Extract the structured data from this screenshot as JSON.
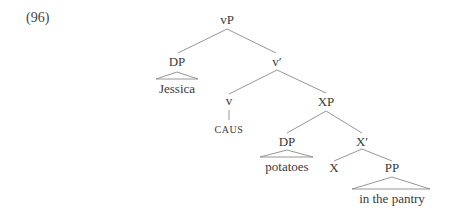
{
  "example": {
    "number": "(96)"
  },
  "tree": {
    "nodes": {
      "vP": "vP",
      "DP_subj": "DP",
      "v_bar": "v′",
      "v": "v",
      "XP": "XP",
      "DP_obj": "DP",
      "X_bar": "X′",
      "X": "X",
      "PP": "PP"
    },
    "leaves": {
      "jessica": "Jessica",
      "caus": "CAUS",
      "potatoes": "potatoes",
      "in_the_pantry": "in the pantry"
    }
  }
}
